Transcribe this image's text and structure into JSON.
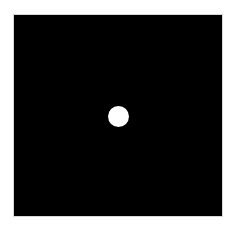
{
  "image": {
    "background_color": "#ffffff",
    "field": {
      "color": "#000000",
      "shape": "square"
    },
    "dot": {
      "color": "#ffffff",
      "shape": "circle"
    }
  }
}
